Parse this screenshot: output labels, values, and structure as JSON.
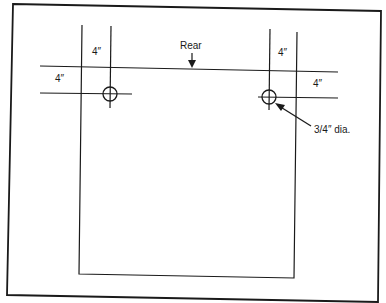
{
  "diagram": {
    "type": "technical-drawing",
    "labels": {
      "rear": "Rear",
      "left_top_offset": "4″",
      "left_side_offset": "4″",
      "right_top_offset": "4″",
      "right_side_offset": "4″",
      "hole_diameter": "3/4″ dia."
    },
    "colors": {
      "line": "#1a1a1a",
      "background": "#ffffff"
    }
  }
}
